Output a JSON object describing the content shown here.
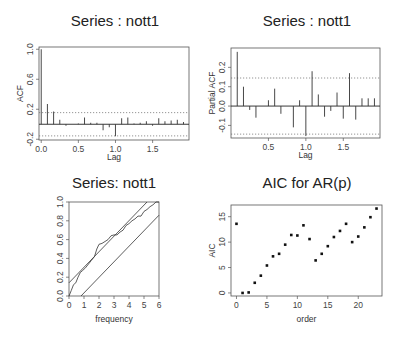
{
  "chart_data": [
    {
      "type": "bar",
      "id": "acf",
      "title": "Series : nott1",
      "xlabel": "Lag",
      "ylabel": "ACF",
      "xlim": [
        -0.03,
        1.99
      ],
      "ylim": [
        -0.21,
        1.03
      ],
      "xticks": [
        0.0,
        0.5,
        1.0,
        1.5
      ],
      "xtick_labels": [
        "0.0",
        "0.5",
        "1.0",
        "1.5"
      ],
      "yticks": [
        -0.2,
        0.2,
        0.6,
        1.0
      ],
      "ytick_labels": [
        "-0.2",
        "0.2",
        "0.6",
        "1.0"
      ],
      "ci": 0.155,
      "lag_step": 0.0833,
      "values": [
        1.0,
        0.27,
        0.17,
        0.06,
        -0.02,
        0.0,
        0.01,
        0.09,
        0.02,
        0.02,
        -0.08,
        -0.04,
        -0.16,
        0.08,
        0.09,
        0.01,
        0.02,
        0.04,
        -0.02,
        0.08,
        0.04,
        0.05,
        0.06,
        0.03
      ],
      "grid": false
    },
    {
      "type": "bar",
      "id": "pacf",
      "title": "Series : nott1",
      "xlabel": "Lag",
      "ylabel": "Partial ACF",
      "xlim": [
        0.0,
        1.99
      ],
      "ylim": [
        -0.165,
        0.3
      ],
      "xticks": [
        0.5,
        1.0,
        1.5
      ],
      "xtick_labels": [
        "0.5",
        "1.0",
        "1.5"
      ],
      "yticks": [
        -0.1,
        0.0,
        0.1,
        0.2
      ],
      "ytick_labels": [
        "-0.1",
        "0.0",
        "0.1",
        "0.2"
      ],
      "ci": 0.145,
      "lag_step": 0.0833,
      "first_lag": 1,
      "values": [
        0.28,
        0.1,
        -0.02,
        -0.06,
        0.0,
        0.03,
        0.09,
        -0.04,
        0.0,
        -0.11,
        0.03,
        -0.155,
        0.18,
        0.06,
        -0.055,
        -0.025,
        0.07,
        -0.065,
        0.17,
        -0.07,
        0.04,
        0.04,
        0.04
      ],
      "grid": false
    },
    {
      "type": "line",
      "id": "cpgram",
      "title": "Series:  nott1",
      "xlabel": "frequency",
      "ylabel": "",
      "xlim": [
        0,
        6
      ],
      "ylim": [
        0,
        1
      ],
      "xticks": [
        0,
        1,
        2,
        3,
        4,
        5,
        6
      ],
      "xtick_labels": [
        "0",
        "1",
        "2",
        "3",
        "4",
        "5",
        "6"
      ],
      "yticks": [
        0.0,
        0.2,
        0.4,
        0.6,
        0.8,
        1.0
      ],
      "ytick_labels": [
        "0.0",
        "0.2",
        "0.4",
        "0.6",
        "0.8",
        "1.0"
      ],
      "series": [
        {
          "name": "cumulative periodogram",
          "x": [
            0,
            0.15,
            0.3,
            0.45,
            0.6,
            0.75,
            0.9,
            1.1,
            1.3,
            1.5,
            1.7,
            1.85,
            2.0,
            2.2,
            2.4,
            2.6,
            2.8,
            3.0,
            3.2,
            3.4,
            3.6,
            3.8,
            4.0,
            4.2,
            4.4,
            4.6,
            4.8,
            5.0,
            5.2,
            5.4,
            5.6,
            5.8,
            6.0
          ],
          "y": [
            0,
            0.06,
            0.12,
            0.14,
            0.2,
            0.25,
            0.27,
            0.3,
            0.34,
            0.38,
            0.42,
            0.5,
            0.55,
            0.56,
            0.58,
            0.6,
            0.64,
            0.65,
            0.65,
            0.68,
            0.7,
            0.75,
            0.77,
            0.8,
            0.82,
            0.85,
            0.85,
            0.9,
            0.92,
            0.95,
            0.97,
            1.0,
            1.0
          ]
        },
        {
          "name": "upper band",
          "x": [
            0,
            5.2
          ],
          "y": [
            0.14,
            1.0
          ]
        },
        {
          "name": "lower band",
          "x": [
            0.8,
            6.0
          ],
          "y": [
            0.0,
            0.86
          ]
        }
      ],
      "grid": false
    },
    {
      "type": "scatter",
      "id": "aic",
      "title": "AIC for AR(p)",
      "xlabel": "order",
      "ylabel": "AIC",
      "xlim": [
        -0.9,
        23.9
      ],
      "ylim": [
        -0.6,
        17.3
      ],
      "xticks": [
        0,
        5,
        10,
        15,
        20
      ],
      "xtick_labels": [
        "0",
        "5",
        "10",
        "15",
        "20"
      ],
      "yticks": [
        0,
        5,
        10,
        15
      ],
      "ytick_labels": [
        "0",
        "5",
        "10",
        "15"
      ],
      "x": [
        0,
        1,
        2,
        3,
        4,
        5,
        6,
        7,
        8,
        9,
        10,
        11,
        12,
        13,
        14,
        15,
        16,
        17,
        18,
        19,
        20,
        21,
        22,
        23
      ],
      "y": [
        13.6,
        0.0,
        0.1,
        2.0,
        3.4,
        5.4,
        7.2,
        7.7,
        9.5,
        11.4,
        11.3,
        13.3,
        10.6,
        6.4,
        7.7,
        9.2,
        11.0,
        12.2,
        13.6,
        10.0,
        11.1,
        12.9,
        14.9,
        16.6
      ],
      "grid": false
    }
  ],
  "panels": {
    "acf": {
      "box": [
        39,
        47,
        189,
        140
      ],
      "title_pos": [
        115,
        26
      ]
    },
    "pacf": {
      "box": [
        231,
        48,
        380,
        138
      ],
      "title_pos": [
        307,
        26
      ]
    },
    "cpgram": {
      "box": [
        69,
        202,
        159,
        296
      ],
      "title_pos": [
        114,
        188
      ]
    },
    "aic": {
      "box": [
        231,
        205,
        382,
        296
      ],
      "title_pos": [
        307,
        188
      ]
    }
  }
}
